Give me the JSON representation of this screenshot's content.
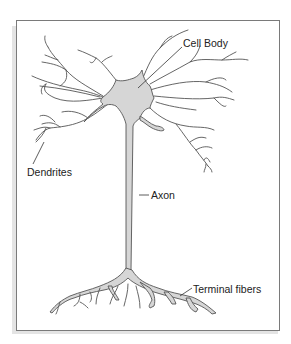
{
  "diagram": {
    "labels": {
      "cell_body": "Cell Body",
      "dendrites": "Dendrites",
      "axon": "Axon",
      "terminal_fibers": "Terminal fibers"
    },
    "colors": {
      "frame_border": "#7a7a7a",
      "frame_shadow": "#e4e4e4",
      "cell_fill": "#d6d6d6",
      "outline": "#555555",
      "text": "#222222"
    }
  }
}
